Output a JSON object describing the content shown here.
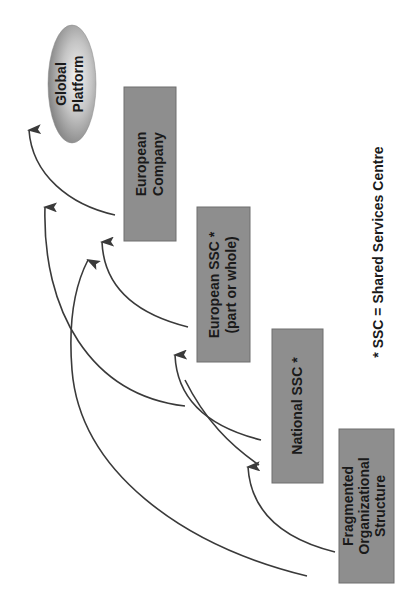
{
  "diagram": {
    "colors": {
      "box_fill": "#8e8e8e",
      "box_edge": "#6e6e6e",
      "arrow": "#3a3a3a",
      "ellipse_light": "#f2f2f2",
      "ellipse_dark": "#7a7a7a",
      "text": "#1a1a1a"
    },
    "nodes": {
      "global_platform": {
        "line1": "Global",
        "line2": "Platform"
      },
      "european_company": {
        "line1": "European",
        "line2": "Company"
      },
      "european_ssc": {
        "line1": "European SSC *",
        "line2": "(part or whole)"
      },
      "national_ssc": {
        "line1": "National SSC *"
      },
      "fragmented": {
        "line1": "Fragmented",
        "line2": "Organizational",
        "line3": "Structure"
      }
    },
    "edges": [
      {
        "from": "European Company",
        "to": "Global Platform"
      },
      {
        "from": "European SSC",
        "to": "European Company"
      },
      {
        "from": "National SSC",
        "to": "European SSC"
      },
      {
        "from": "Fragmented Organizational Structure",
        "to": "National SSC"
      },
      {
        "from": "National SSC",
        "to": "Global Platform"
      },
      {
        "from": "Fragmented Organizational Structure",
        "to": "European Company"
      },
      {
        "from": "European SSC",
        "to": "Global Platform"
      }
    ],
    "footnote": "* SSC = Shared Services Centre"
  }
}
